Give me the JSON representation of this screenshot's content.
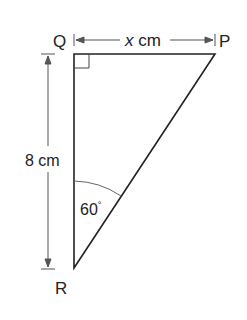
{
  "diagram": {
    "type": "right-triangle",
    "vertices": {
      "Q": {
        "label": "Q",
        "x": 74,
        "y": 54
      },
      "P": {
        "label": "P",
        "x": 215,
        "y": 54
      },
      "R": {
        "label": "R",
        "x": 74,
        "y": 268
      }
    },
    "right_angle_at": "Q",
    "dimensions": {
      "QP": {
        "label_var": "x",
        "label_unit": " cm"
      },
      "QR": {
        "label": "8 cm"
      }
    },
    "angle_R": {
      "label": "60",
      "degree": "°"
    },
    "colors": {
      "line": "#222222",
      "dimension": "#555555"
    }
  }
}
